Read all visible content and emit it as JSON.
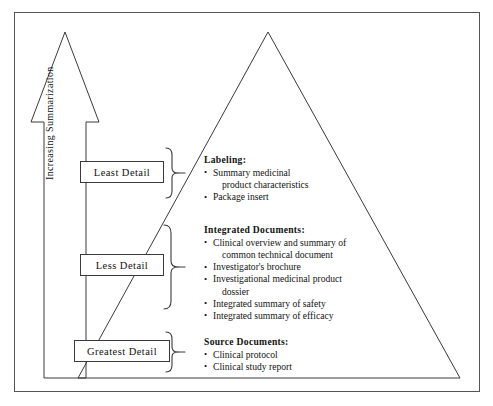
{
  "figure": {
    "axis_label": "Increasing Summarization",
    "colors": {
      "stroke": "#3a3a3a",
      "border": "#555555",
      "background": "#ffffff",
      "text": "#121212"
    }
  },
  "detail_levels": [
    {
      "id": "least",
      "label": "Least Detail"
    },
    {
      "id": "less",
      "label": "Less Detail"
    },
    {
      "id": "greatest",
      "label": "Greatest Detail"
    }
  ],
  "tiers": [
    {
      "id": "labeling",
      "heading": "Labeling:",
      "items": [
        {
          "text": "Summary medicinal",
          "continuation": "product characteristics"
        },
        {
          "text": "Package insert",
          "continuation": ""
        }
      ]
    },
    {
      "id": "integrated",
      "heading": "Integrated Documents:",
      "items": [
        {
          "text": "Clinical overview and summary of",
          "continuation": "common technical document"
        },
        {
          "text": "Investigator's brochure",
          "continuation": ""
        },
        {
          "text": "Investigational medicinal product",
          "continuation": "dossier"
        },
        {
          "text": "Integrated summary of safety",
          "continuation": ""
        },
        {
          "text": "Integrated summary of efficacy",
          "continuation": ""
        }
      ]
    },
    {
      "id": "source",
      "heading": "Source Documents:",
      "items": [
        {
          "text": "Clinical protocol",
          "continuation": ""
        },
        {
          "text": "Clinical study report",
          "continuation": ""
        }
      ]
    }
  ]
}
